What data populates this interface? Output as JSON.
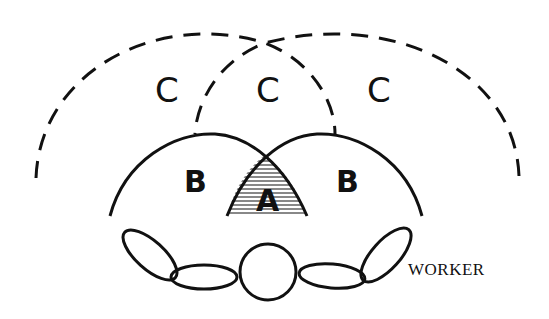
{
  "diagram": {
    "zones": {
      "c_left": "C",
      "c_center": "C",
      "c_right": "C",
      "b_left": "B",
      "b_right": "B",
      "a_center": "A"
    },
    "worker_label": "WORKER",
    "colors": {
      "stroke": "#111111",
      "background": "#ffffff",
      "hatch": "#111111"
    },
    "legend": {
      "A": "Optimum work area (hatched overlap of both normal reach zones)",
      "B": "Normal reach area (solid arcs)",
      "C": "Maximum reach area (dashed arcs)"
    }
  }
}
